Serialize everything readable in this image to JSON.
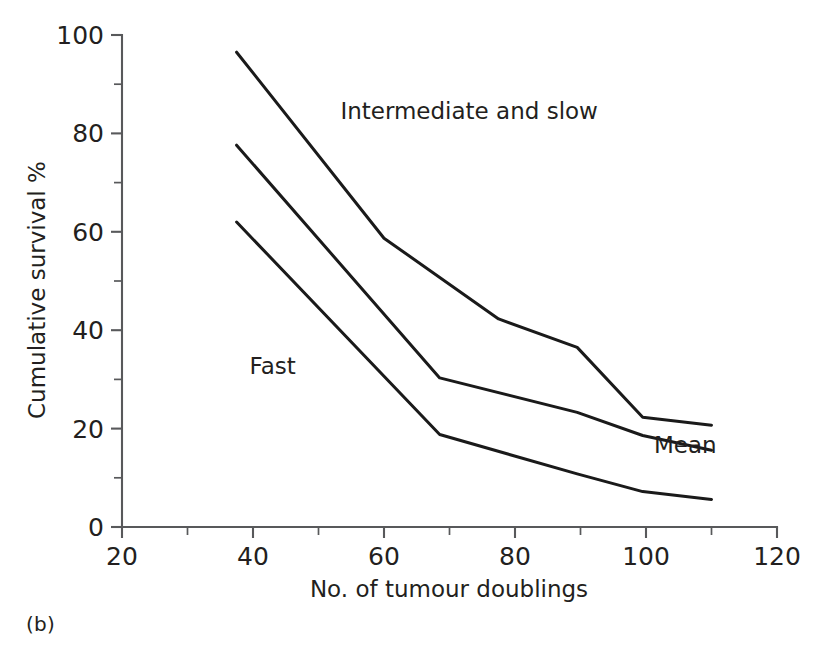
{
  "figure": {
    "caption": "(b)"
  },
  "chart_data": {
    "type": "line",
    "title": "",
    "xlabel": "No. of tumour doublings",
    "ylabel": "Cumulative survival %",
    "xlim": [
      20,
      120
    ],
    "ylim": [
      0,
      100
    ],
    "xticks": [
      20,
      40,
      60,
      80,
      100,
      120
    ],
    "xtick_labels": [
      "20",
      "40",
      "60",
      "80",
      "100",
      "120"
    ],
    "xminor_step": 10,
    "yticks": [
      0,
      20,
      40,
      60,
      80,
      100
    ],
    "ytick_labels": [
      "0",
      "20",
      "40",
      "60",
      "80",
      "100"
    ],
    "yminor_step": 10,
    "grid": false,
    "legend_position": "inline-annotations",
    "annotations": [
      {
        "text": "Intermediate and slow",
        "x": 73,
        "y": 83
      },
      {
        "text": "Fast",
        "x": 43,
        "y": 31
      },
      {
        "text": "Mean",
        "x": 106,
        "y": 15
      }
    ],
    "series": [
      {
        "name": "Intermediate and slow",
        "x": [
          37.5,
          60.0,
          77.5,
          89.5,
          99.5,
          110.0
        ],
        "values": [
          96.5,
          58.7,
          42.3,
          36.5,
          22.3,
          20.7
        ]
      },
      {
        "name": "Mean",
        "x": [
          37.5,
          68.5,
          89.5,
          99.5,
          110.0
        ],
        "values": [
          77.6,
          30.3,
          23.3,
          18.6,
          15.6
        ]
      },
      {
        "name": "Fast",
        "x": [
          37.5,
          68.5,
          89.5,
          99.5,
          110.0
        ],
        "values": [
          62.0,
          18.8,
          10.8,
          7.2,
          5.6
        ]
      }
    ]
  }
}
